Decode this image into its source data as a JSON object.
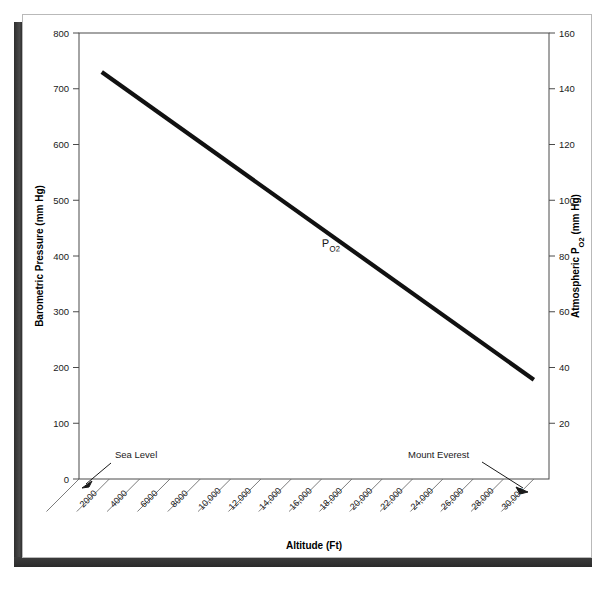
{
  "figure": {
    "background_color": "#ffffff",
    "frame_color": "#b9b9b9",
    "shadow_color": "#333333",
    "line_color": "#111111"
  },
  "chart_data": {
    "type": "line",
    "title": "",
    "xlabel": "Altitude (Ft)",
    "ylabel": "Barometric Pressure (mm Hg)",
    "y2label_main": "Atmospheric P",
    "y2label_sub": "O",
    "y2label_sub2": "2",
    "y2label_tail": " (mm Hg)",
    "ylim": [
      0,
      800
    ],
    "y2lim": [
      0,
      160
    ],
    "xlim": [
      0,
      31000
    ],
    "grid": false,
    "legend": "none",
    "series": [
      {
        "name": "PO2",
        "label_main": "P",
        "label_sub": "O",
        "label_sub2": "2",
        "x": [
          1500,
          30000
        ],
        "y": [
          730,
          178
        ],
        "y2": [
          146,
          35.6
        ]
      }
    ],
    "y_ticks": [
      "800",
      "700",
      "600",
      "500",
      "400",
      "300",
      "200",
      "100",
      "0"
    ],
    "y_tick_values": [
      800,
      700,
      600,
      500,
      400,
      300,
      200,
      100,
      0
    ],
    "y2_ticks": [
      "160",
      "140",
      "120",
      "100",
      "80",
      "60",
      "40",
      "20"
    ],
    "y2_tick_values": [
      160,
      140,
      120,
      100,
      80,
      60,
      40,
      20
    ],
    "x_ticks": [
      "2000",
      "4000",
      "6000",
      "8000",
      "10,000",
      "12,000",
      "14,000",
      "16,000",
      "18,000",
      "20,000",
      "22,000",
      "24,000",
      "26,000",
      "28,000",
      "30,000"
    ],
    "x_tick_values": [
      2000,
      4000,
      6000,
      8000,
      10000,
      12000,
      14000,
      16000,
      18000,
      20000,
      22000,
      24000,
      26000,
      28000,
      30000
    ],
    "annotations": [
      {
        "name": "sea-level",
        "text": "Sea Level",
        "points_to": "origin (0 ft, 760 mm Hg baseline)"
      },
      {
        "name": "mount-everest",
        "text": "Mount Everest",
        "points_to": "29,000 ft, ~253 mm Hg"
      }
    ]
  }
}
